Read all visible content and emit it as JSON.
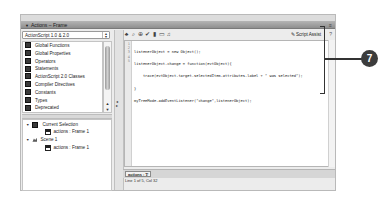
{
  "window": {
    "title": "Actions – Frame",
    "collapse_glyph": "▼",
    "menu_glyph": "≡"
  },
  "toolbox": {
    "dropdown_value": "ActionScript 1.0 & 2.0",
    "items": [
      {
        "label": "Global Functions",
        "icon": "book-icon"
      },
      {
        "label": "Global Properties",
        "icon": "book-icon"
      },
      {
        "label": "Operators",
        "icon": "book-icon"
      },
      {
        "label": "Statements",
        "icon": "book-icon"
      },
      {
        "label": "ActionScript 2.0 Classes",
        "icon": "book-icon"
      },
      {
        "label": "Compiler Directives",
        "icon": "book-icon"
      },
      {
        "label": "Constants",
        "icon": "book-icon"
      },
      {
        "label": "Types",
        "icon": "book-icon"
      },
      {
        "label": "Deprecated",
        "icon": "book-icon"
      },
      {
        "label": "Data Components",
        "icon": "book-icon"
      }
    ]
  },
  "script_navigator": {
    "nodes": [
      {
        "label": "Current Selection",
        "level": 0,
        "icon": "book-icon",
        "expanded": true
      },
      {
        "label": "actions : Frame 1",
        "level": 1,
        "icon": "script-icon"
      },
      {
        "label": "Scene 1",
        "level": 0,
        "icon": "scene-icon",
        "expanded": true
      },
      {
        "label": "actions : Frame 1",
        "level": 1,
        "icon": "script-icon"
      }
    ]
  },
  "toolbar": {
    "buttons": [
      "add-statement",
      "find",
      "insert-target-path",
      "check-syntax",
      "auto-format",
      "show-code-hint",
      "debug-options"
    ],
    "glyphs": [
      "♣",
      "⌕",
      "⊕",
      "✔",
      "▮",
      "▭",
      "♫"
    ],
    "script_assist_label": "Script Assist",
    "help_glyph": "?"
  },
  "code": {
    "line_numbers": [
      "1",
      "2",
      "3",
      "4",
      "5"
    ],
    "lines": [
      "listenerObject = new Object();",
      "listenerObject.change = function(evtObject){",
      "    trace(evtObject.target.selectedItem.attributes.label + \" was selected\");",
      "}",
      "myTreeMode.addEventListener(\"change\",listenerObject);"
    ]
  },
  "bottom": {
    "tab_label": "actions : 1",
    "status": "Line 1 of 5, Col 32"
  },
  "callout": {
    "number": "7"
  }
}
